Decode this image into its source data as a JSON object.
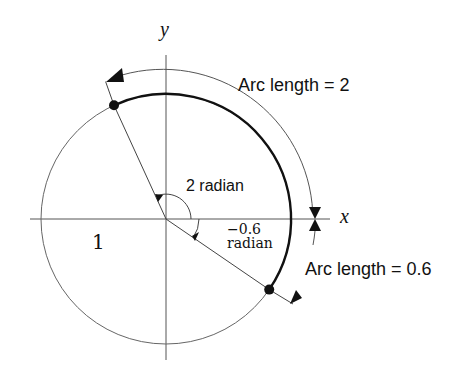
{
  "diagram": {
    "axes": {
      "x_label": "x",
      "y_label": "y"
    },
    "radius_label": "1",
    "angle_positive": {
      "value_label": "2 radian",
      "radians": 2
    },
    "angle_negative": {
      "value_label": "−0.6",
      "unit_label": "radian",
      "radians": -0.6
    },
    "arc_positive_label": "Arc length = 2",
    "arc_negative_label": "Arc length = 0.6",
    "colors": {
      "stroke": "#333333",
      "thick_arc": "#111111",
      "background": "#ffffff"
    }
  }
}
